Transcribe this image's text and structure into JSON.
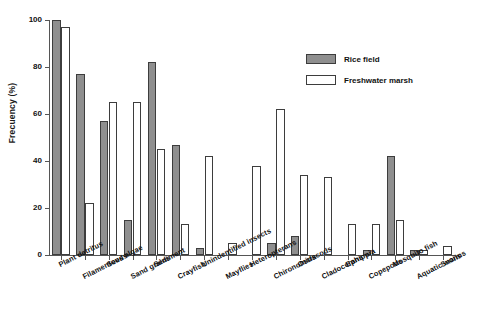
{
  "chart_data": {
    "type": "bar",
    "title": "",
    "xlabel": "",
    "ylabel": "Frecuency (%)",
    "ylim": [
      0,
      100
    ],
    "yticks": [
      0,
      20,
      40,
      60,
      80,
      100
    ],
    "grid": false,
    "legend_position": "top-right",
    "categories": [
      "Plant detritus",
      "Filamentous algae",
      "Seeds",
      "Sand grains",
      "Sediment",
      "Crayfish",
      "Unindentified insects",
      "Mayflies",
      "Heteropterans",
      "Chironomids",
      "Ostracods",
      "Cladocerans",
      "Ephippia",
      "Copepods",
      "Mosquito fish",
      "Aquatic worms",
      "Snails"
    ],
    "series": [
      {
        "name": "Rice  field",
        "color": "#8f8f8f",
        "values": [
          100,
          77,
          57,
          15,
          82,
          47,
          3,
          0,
          0,
          5,
          8,
          0,
          0,
          2,
          42,
          2,
          0
        ]
      },
      {
        "name": "Freshwater marsh",
        "color": "#ffffff",
        "values": [
          97,
          22,
          65,
          65,
          45,
          13,
          42,
          5,
          38,
          62,
          34,
          33,
          13,
          13,
          15,
          2,
          4
        ]
      }
    ]
  },
  "legend": {
    "entries": [
      {
        "label": "Rice  field",
        "swatch": "rice"
      },
      {
        "label": "Freshwater marsh",
        "swatch": "marsh"
      }
    ]
  }
}
